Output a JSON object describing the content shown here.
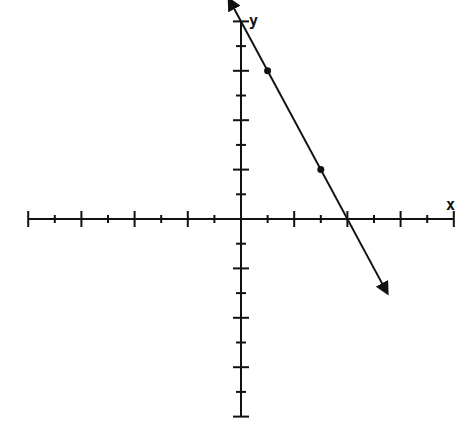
{
  "chart_data": {
    "type": "line",
    "title": "",
    "xlabel": "x",
    "ylabel": "y",
    "xlim": [
      -8,
      8
    ],
    "ylim": [
      -8,
      8
    ],
    "grid": false,
    "x_ticks": {
      "major_every": 2,
      "minor_every": 1
    },
    "y_ticks": {
      "major_every": 2,
      "minor_every": 1
    },
    "series": [
      {
        "name": "line",
        "equation": "y = -2x + 8",
        "slope": -2,
        "intercept": 8,
        "arrows": "both",
        "marked_points": [
          {
            "x": 1,
            "y": 6
          },
          {
            "x": 3,
            "y": 2
          }
        ]
      }
    ],
    "colors": {
      "ink": "#111111",
      "background": "#ffffff"
    }
  },
  "labels": {
    "x": "x",
    "y": "y"
  }
}
